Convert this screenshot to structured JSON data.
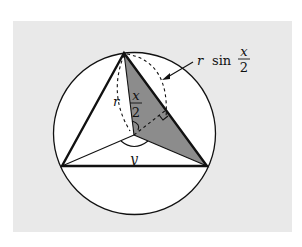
{
  "figure": {
    "background_color": "#e9e9e9",
    "shade_color": "#8c8c8c",
    "stroke_color": "#111111",
    "labels": {
      "r": "r",
      "half_angle_num": "x",
      "half_angle_den": "2",
      "central_angle": "y",
      "callout_r": "r",
      "callout_sin": "sin",
      "callout_num": "x",
      "callout_den": "2"
    }
  }
}
